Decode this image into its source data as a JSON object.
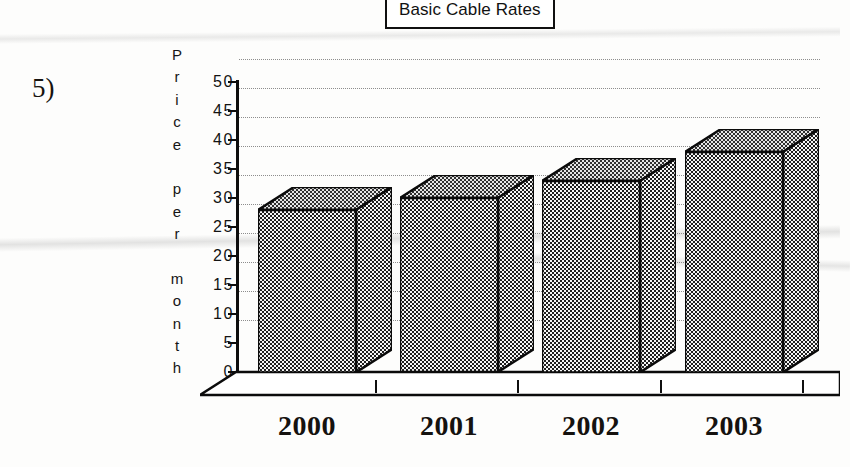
{
  "question": {
    "number": "5)"
  },
  "chart_data": {
    "type": "bar",
    "title": "Basic Cable Rates",
    "xlabel": "",
    "ylabel": "Price per month",
    "ylabel_letters": [
      "P",
      "r",
      "i",
      "c",
      "e",
      " ",
      "p",
      "e",
      "r",
      " ",
      "m",
      "o",
      "n",
      "t",
      "h"
    ],
    "categories": [
      "2000",
      "2001",
      "2002",
      "2003"
    ],
    "values": [
      28,
      30,
      33,
      38
    ],
    "ylim": [
      0,
      50
    ],
    "ytick_values": [
      "50",
      "45",
      "40",
      "35",
      "30",
      "25",
      "20",
      "15",
      "10",
      "5",
      "0"
    ],
    "grid": true,
    "legend": "none",
    "style": "3d-bar",
    "bar_color": "#6f6f6f",
    "outline_color": "#0b0b0b"
  }
}
